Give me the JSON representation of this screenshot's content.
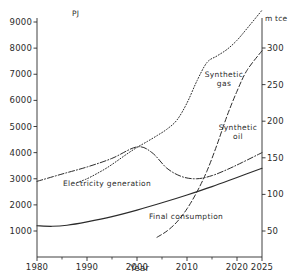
{
  "chart_data": {
    "type": "line",
    "title": "",
    "xlabel": "Year",
    "ylabel": "PJ",
    "y2label": "m tce",
    "xlim": [
      1980,
      2025
    ],
    "ylim": [
      0,
      9500
    ],
    "y2lim": [
      0,
      355
    ],
    "grid": false,
    "legend_position": "inline-annotations",
    "xticks": [
      1980,
      1990,
      2000,
      2010,
      2020,
      2025
    ],
    "xtick_labels": [
      "1980",
      "1990",
      "2000",
      "2010",
      "2020",
      "2025"
    ],
    "xminor_ticks": [
      1985,
      1995,
      2005,
      2015
    ],
    "yticks": [
      1000,
      2000,
      3000,
      4000,
      5000,
      6000,
      7000,
      8000,
      9000
    ],
    "ytick_labels": [
      "1000",
      "2000",
      "3000",
      "4000",
      "5000",
      "6000",
      "7000",
      "8000",
      "9000"
    ],
    "y2ticks": [
      50,
      100,
      150,
      200,
      250,
      300
    ],
    "y2tick_labels": [
      "50",
      "100",
      "150",
      "200",
      "250",
      "300"
    ],
    "series": [
      {
        "name": "Synthetic gas",
        "style": "dotted",
        "label_lines": [
          "Synthetic",
          "gas"
        ],
        "x": [
          1988,
          1990,
          1992,
          1994,
          1996,
          1998,
          2000,
          2002,
          2004,
          2006,
          2008,
          2010,
          2012,
          2014,
          2016,
          2018,
          2020,
          2022,
          2025
        ],
        "y": [
          2850,
          3000,
          3200,
          3420,
          3680,
          3950,
          4200,
          4420,
          4650,
          4900,
          5250,
          5900,
          6750,
          7450,
          7700,
          7950,
          8300,
          8750,
          9450
        ]
      },
      {
        "name": "Synthetic oil",
        "style": "dashed",
        "label_lines": [
          "Synthetic",
          "oil"
        ],
        "x": [
          2004,
          2006,
          2008,
          2010,
          2012,
          2014,
          2016,
          2018,
          2020,
          2022,
          2025
        ],
        "y": [
          760,
          1000,
          1350,
          1850,
          2500,
          3300,
          4300,
          5400,
          6350,
          7150,
          7900
        ]
      },
      {
        "name": "Electricity generation",
        "style": "dash-dot",
        "label_lines": [
          "Electricity  generation"
        ],
        "x": [
          1980,
          1985,
          1990,
          1995,
          2000,
          2003,
          2006,
          2009,
          2012,
          2015,
          2018,
          2021,
          2025
        ],
        "y": [
          2900,
          3180,
          3450,
          3780,
          4220,
          4000,
          3400,
          3080,
          3000,
          3120,
          3350,
          3620,
          4000
        ]
      },
      {
        "name": "Final consumption",
        "style": "solid",
        "label_lines": [
          "Final consumption"
        ],
        "x": [
          1980,
          1983,
          1986,
          1990,
          1995,
          2000,
          2005,
          2010,
          2015,
          2020,
          2025
        ],
        "y": [
          1200,
          1180,
          1220,
          1350,
          1550,
          1800,
          2080,
          2380,
          2700,
          3050,
          3400
        ]
      }
    ]
  },
  "axes": {
    "left_unit": "PJ",
    "right_unit": "m tce",
    "x_title": "Year"
  }
}
